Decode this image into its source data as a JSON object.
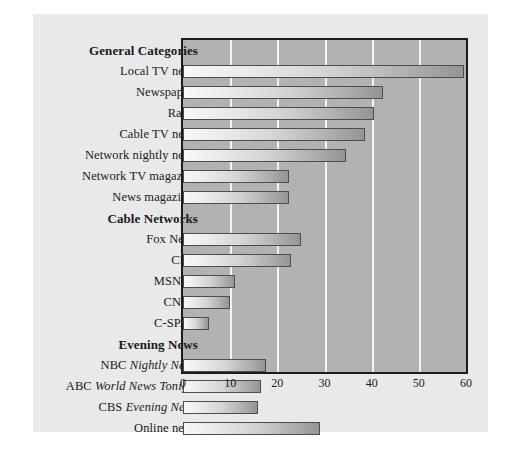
{
  "chart_data": {
    "type": "bar",
    "orientation": "horizontal",
    "title": "",
    "xlabel": "",
    "ylabel": "",
    "xlim": [
      0,
      60
    ],
    "xticks": [
      0,
      10,
      20,
      30,
      40,
      50,
      60
    ],
    "grid": true,
    "legend": false,
    "groups": [
      {
        "header": "General Categories",
        "categories": [
          "Local TV news",
          "Newspapers",
          "Radio",
          "Cable TV news",
          "Network nightly news",
          "Network TV magazine",
          "News magazines"
        ],
        "values": [
          59.5,
          42.5,
          40.5,
          38.5,
          34.5,
          22.5,
          22.5
        ]
      },
      {
        "header": "Cable Networks",
        "categories": [
          "Fox News",
          "CNN",
          "MSNBC",
          "CNBC",
          "C-SPAN"
        ],
        "values": [
          25,
          23,
          11,
          10,
          5.5
        ]
      },
      {
        "header": "Evening News",
        "categories": [
          "NBC Nightly News",
          "ABC World News Tonight",
          "CBS Evening News",
          "Online news"
        ],
        "values": [
          17.5,
          16.5,
          16,
          29
        ]
      }
    ]
  },
  "rows": [
    {
      "label": "General Categories",
      "is_header": true,
      "value": null
    },
    {
      "label": "Local TV news",
      "is_header": false,
      "value": 59.5
    },
    {
      "label": "Newspapers",
      "is_header": false,
      "value": 42.5
    },
    {
      "label": "Radio",
      "is_header": false,
      "value": 40.5
    },
    {
      "label": "Cable TV news",
      "is_header": false,
      "value": 38.5
    },
    {
      "label": "Network nightly news",
      "is_header": false,
      "value": 34.5
    },
    {
      "label": "Network TV magazine",
      "is_header": false,
      "value": 22.5
    },
    {
      "label": "News magazines",
      "is_header": false,
      "value": 22.5
    },
    {
      "label": "Cable Networks",
      "is_header": true,
      "value": null
    },
    {
      "label": "Fox News",
      "is_header": false,
      "value": 25
    },
    {
      "label": "CNN",
      "is_header": false,
      "value": 23
    },
    {
      "label": "MSNBC",
      "is_header": false,
      "value": 11
    },
    {
      "label": "CNBC",
      "is_header": false,
      "value": 10
    },
    {
      "label": "C-SPAN",
      "is_header": false,
      "value": 5.5
    },
    {
      "label": "Evening News",
      "is_header": true,
      "value": null
    },
    {
      "label": "NBC Nightly News",
      "is_header": false,
      "value": 17.5,
      "plain": "NBC ",
      "italic": "Nightly News"
    },
    {
      "label": "ABC World News Tonight",
      "is_header": false,
      "value": 16.5,
      "plain": "ABC ",
      "italic": "World News Tonight"
    },
    {
      "label": "CBS Evening News",
      "is_header": false,
      "value": 16,
      "plain": "CBS ",
      "italic": "Evening News"
    },
    {
      "label": "Online news",
      "is_header": false,
      "value": 29
    }
  ],
  "axis": {
    "ticks": [
      "0",
      "10",
      "20",
      "30",
      "40",
      "50",
      "60"
    ],
    "min": 0,
    "max": 60
  },
  "colors": {
    "card_background": "#e9e9e9",
    "plot_background": "#b2b2b2",
    "gridline": "#f3f3f3",
    "frame": "#1c1c1c",
    "bar_light": "#f7f7f7",
    "bar_dark": "#949494",
    "bar_outline": "#4d4d4d",
    "text": "#1a1a1a"
  }
}
